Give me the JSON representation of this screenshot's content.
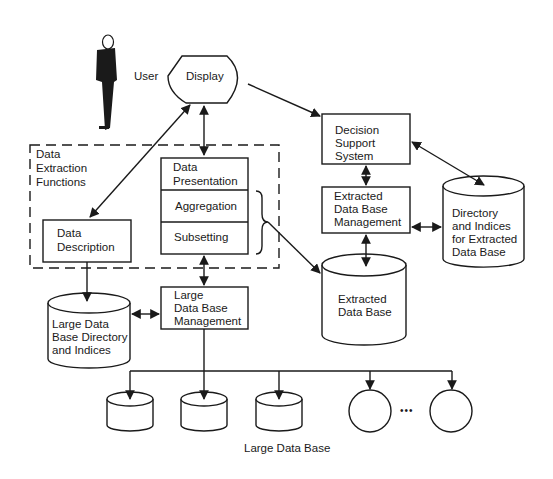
{
  "diagram": {
    "user_label": "User",
    "display_label": "Display",
    "extraction_group": {
      "title_lines": [
        "Data",
        "Extraction",
        "Functions"
      ]
    },
    "data_description": [
      "Data",
      "Description"
    ],
    "stack": {
      "presentation": [
        "Data",
        "Presentation"
      ],
      "aggregation": "Aggregation",
      "subsetting": "Subsetting"
    },
    "decision_support": [
      "Decision",
      "Support",
      "System"
    ],
    "extracted_dbm": [
      "Extracted",
      "Data Base",
      "Management"
    ],
    "extracted_dir": [
      "Directory",
      "and Indices",
      "for Extracted",
      "Data Base"
    ],
    "extracted_db": [
      "Extracted",
      "Data Base"
    ],
    "large_dir": [
      "Large Data",
      "Base Directory",
      "and Indices"
    ],
    "large_dbm": [
      "Large",
      "Data Base",
      "Management"
    ],
    "large_db_caption": "Large Data Base",
    "ellipsis": "•••",
    "colors": {
      "ink": "#1a1a1a",
      "background": "#ffffff"
    }
  }
}
